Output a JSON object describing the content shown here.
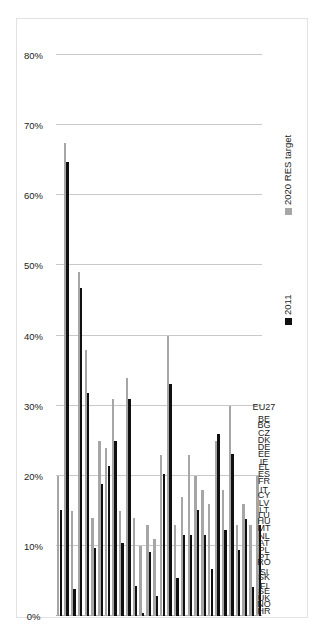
{
  "figure": {
    "frame_color": "#e2e2e2",
    "background": "#ffffff",
    "orientation": "rotated-90-ccw"
  },
  "legend": {
    "position": "right-middle",
    "entries": [
      {
        "label": "2020 RES target",
        "color": "#a6a6a6",
        "swatch": "grey-square-icon"
      },
      {
        "label": "2011",
        "color": "#101010",
        "swatch": "black-square-icon"
      }
    ]
  },
  "axis": {
    "tick_labels": [
      "0%",
      "10%",
      "20%",
      "30%",
      "40%",
      "50%",
      "60%",
      "70%",
      "80%"
    ],
    "tick_values": [
      0,
      10,
      20,
      30,
      40,
      50,
      60,
      70,
      80
    ]
  },
  "chart_data": {
    "type": "bar",
    "title": "",
    "subtitle": "",
    "xlabel": "",
    "ylabel": "",
    "orientation": "horizontal",
    "grid": true,
    "legend_position": "right",
    "xlim": [
      0,
      85
    ],
    "xticks": [
      0,
      10,
      20,
      30,
      40,
      50,
      60,
      70,
      80
    ],
    "xticklabels": [
      "0%",
      "10%",
      "20%",
      "30%",
      "40%",
      "50%",
      "60%",
      "70%",
      "80%"
    ],
    "categories": [
      "EU27",
      "BE",
      "BG",
      "CZ",
      "DK",
      "DE",
      "EE",
      "IE",
      "EL",
      "ES",
      "FR",
      "IT",
      "CY",
      "LV",
      "LT",
      "LU",
      "HU",
      "MT",
      "NL",
      "AT",
      "PL",
      "PT",
      "RO",
      "SI",
      "SK",
      "FI",
      "SE",
      "UK",
      "NO",
      "HR"
    ],
    "series": [
      {
        "name": "2011",
        "color": "#101010",
        "values": [
          13.0,
          4.1,
          13.8,
          9.4,
          23.1,
          12.3,
          25.9,
          6.7,
          11.6,
          15.1,
          11.5,
          11.5,
          5.4,
          33.1,
          20.3,
          2.9,
          9.1,
          0.4,
          4.3,
          30.9,
          10.4,
          24.9,
          21.4,
          18.8,
          9.7,
          31.8,
          46.8,
          3.8,
          64.7,
          15.1
        ]
      },
      {
        "name": "2020 RES target",
        "color": "#a6a6a6",
        "values": [
          20.0,
          13.0,
          16.0,
          13.0,
          30.0,
          18.0,
          25.0,
          16.0,
          18.0,
          20.0,
          23.0,
          17.0,
          13.0,
          40.0,
          23.0,
          11.0,
          13.0,
          10.0,
          14.0,
          34.0,
          15.0,
          31.0,
          24.0,
          25.0,
          14.0,
          38.0,
          49.0,
          15.0,
          67.5,
          20.0
        ]
      }
    ]
  }
}
